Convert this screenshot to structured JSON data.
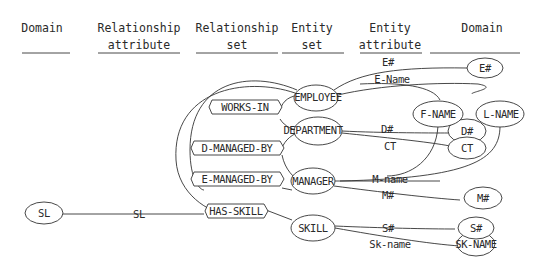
{
  "headers": [
    {
      "line1": "Domain",
      "line2": ""
    },
    {
      "line1": "Relationship",
      "line2": "attribute"
    },
    {
      "line1": "Relationship",
      "line2": "set"
    },
    {
      "line1": "Entity",
      "line2": "set"
    },
    {
      "line1": "Entity",
      "line2": "attribute"
    },
    {
      "line1": "Domain",
      "line2": ""
    }
  ],
  "relationship_sets": [
    "WORKS-IN",
    "D-MANAGED-BY",
    "E-MANAGED-BY",
    "HAS-SKILL"
  ],
  "entity_sets": [
    "EMPLOYEE",
    "DEPARTMENT",
    "MANAGER",
    "SKILL"
  ],
  "entity_attributes": [
    "E#",
    "E-Name",
    "D#",
    "CT",
    "M-name",
    "M#",
    "S#",
    "Sk-name"
  ],
  "domains_right": [
    "E#",
    "F-NAME",
    "L-NAME",
    "D#",
    "CT",
    "M#",
    "S#",
    "SK-NAME"
  ],
  "domains_left": [
    "SL"
  ],
  "relationship_attributes": [
    "SL"
  ]
}
